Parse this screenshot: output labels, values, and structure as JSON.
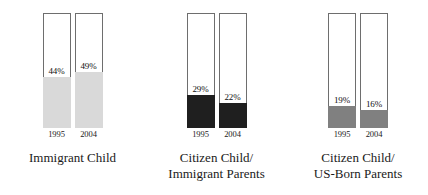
{
  "chart_data": {
    "type": "bar",
    "title": "",
    "subtitle": "",
    "xlabel": "",
    "ylabel": "",
    "ylim": [
      0,
      100
    ],
    "grid": false,
    "legend_position": "none",
    "orientation": "vertical",
    "stacked_to_full_height": true,
    "value_suffix": "%",
    "categories": [
      "Immigrant Child",
      "Citizen Child/ Immigrant Parents",
      "Citizen Child/ US-Born Parents"
    ],
    "x": [
      "1995",
      "2004"
    ],
    "series": [
      {
        "name": "1995",
        "values": [
          44,
          29,
          19
        ]
      },
      {
        "name": "2004",
        "values": [
          49,
          22,
          16
        ]
      }
    ],
    "groups": [
      {
        "caption_lines": [
          "Immigrant Child"
        ],
        "fill_color": "#d9d9d9",
        "bars": [
          {
            "year": "1995",
            "value": 44,
            "label": "44%"
          },
          {
            "year": "2004",
            "value": 49,
            "label": "49%"
          }
        ]
      },
      {
        "caption_lines": [
          "Citizen Child/",
          "Immigrant Parents"
        ],
        "fill_color": "#1f1f1f",
        "bars": [
          {
            "year": "1995",
            "value": 29,
            "label": "29%"
          },
          {
            "year": "2004",
            "value": 22,
            "label": "22%"
          }
        ]
      },
      {
        "caption_lines": [
          "Citizen Child/",
          "US-Born Parents"
        ],
        "fill_color": "#808080",
        "bars": [
          {
            "year": "1995",
            "value": 19,
            "label": "19%"
          },
          {
            "year": "2004",
            "value": 16,
            "label": "16%"
          }
        ]
      }
    ],
    "colors": {
      "background": "#ffffff",
      "bar_outline": "#6e6e6e",
      "text": "#1a1a1a",
      "fill_light_gray": "#d9d9d9",
      "fill_black": "#1f1f1f",
      "fill_medium_gray": "#808080"
    }
  }
}
